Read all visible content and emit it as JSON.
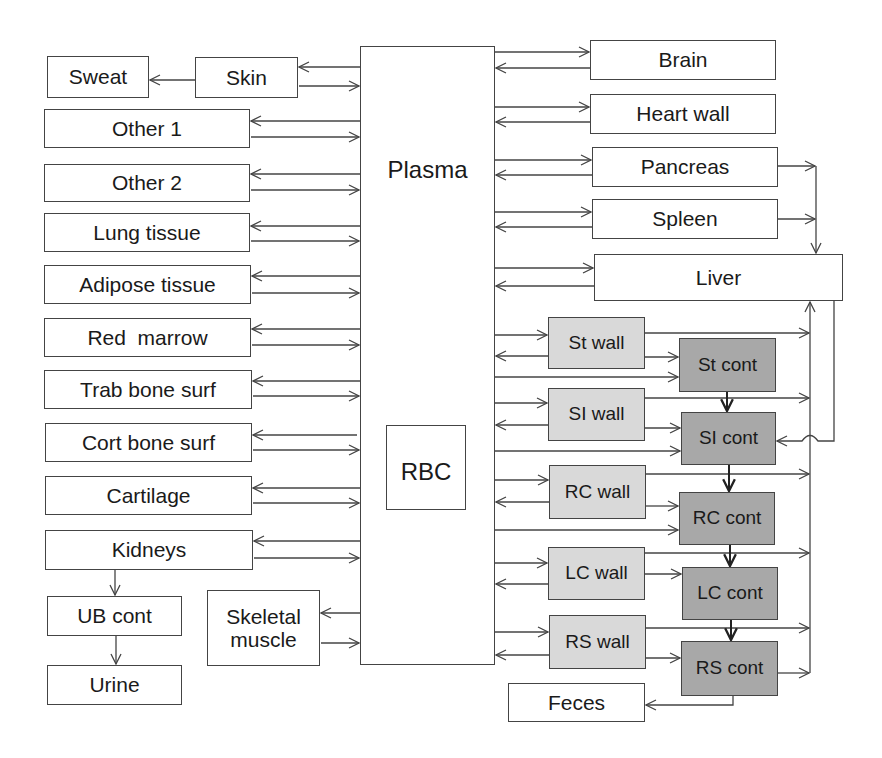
{
  "diagram": {
    "type": "compartment-model",
    "colors": {
      "line": "#444444",
      "box_fill": "#ffffff",
      "wall_fill": "#d9d9d9",
      "content_fill": "#a8a8a8"
    },
    "central": {
      "plasma": "Plasma",
      "rbc": "RBC"
    },
    "left": {
      "sweat": "Sweat",
      "skin": "Skin",
      "other1": "Other 1",
      "other2": "Other 2",
      "lung": "Lung tissue",
      "adipose": "Adipose tissue",
      "red_marrow": "Red  marrow",
      "trab_bone": "Trab bone surf",
      "cort_bone": "Cort bone surf",
      "cartilage": "Cartilage",
      "kidneys": "Kidneys",
      "ub_cont": "UB cont",
      "urine": "Urine",
      "skeletal_muscle": "Skeletal muscle"
    },
    "right": {
      "brain": "Brain",
      "heart_wall": "Heart wall",
      "pancreas": "Pancreas",
      "spleen": "Spleen",
      "liver": "Liver",
      "feces": "Feces"
    },
    "git_walls": {
      "st": "St wall",
      "si": "SI wall",
      "rc": "RC wall",
      "lc": "LC wall",
      "rs": "RS wall"
    },
    "git_contents": {
      "st": "St cont",
      "si": "SI cont",
      "rc": "RC cont",
      "lc": "LC cont",
      "rs": "RS cont"
    }
  }
}
